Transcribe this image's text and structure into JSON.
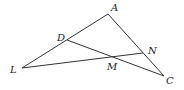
{
  "figure": {
    "width": 184,
    "height": 90,
    "line_color": "#333333",
    "points": {
      "A": {
        "x": 108,
        "y": 14,
        "label": "A",
        "lx": 111,
        "ly": 11
      },
      "D": {
        "x": 67,
        "y": 40,
        "label": "D",
        "lx": 57,
        "ly": 41
      },
      "L": {
        "x": 22,
        "y": 68,
        "label": "L",
        "lx": 10,
        "ly": 73
      },
      "N": {
        "x": 143,
        "y": 53,
        "label": "N",
        "lx": 148,
        "ly": 54
      },
      "M": {
        "x": 111,
        "y": 57,
        "label": "M",
        "lx": 107,
        "ly": 70
      },
      "C": {
        "x": 164,
        "y": 76,
        "label": "C",
        "lx": 166,
        "ly": 84
      }
    },
    "segments": [
      [
        "L",
        "A"
      ],
      [
        "A",
        "C"
      ],
      [
        "D",
        "C"
      ],
      [
        "L",
        "N"
      ]
    ]
  }
}
